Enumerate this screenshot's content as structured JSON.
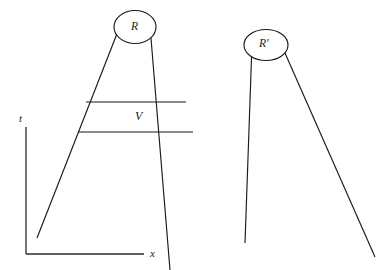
{
  "figure": {
    "type": "spacetime-diagram",
    "background_color": "#ffffff",
    "line_color": "#1a1a1a",
    "axes": {
      "vertical_label": "t",
      "horizontal_label": "x",
      "origin": {
        "x": 26,
        "y": 254
      },
      "vertical_top": {
        "x": 26,
        "y": 127
      },
      "horizontal_right": {
        "x": 144,
        "y": 254
      }
    },
    "regions": [
      {
        "name": "region-R",
        "label": "R",
        "ellipse": {
          "cx": 135,
          "cy": 27,
          "rx": 21,
          "ry": 16.5
        },
        "left_leg": {
          "x1": 37,
          "y1": 238,
          "x2": 120,
          "y2": 26
        },
        "right_leg": {
          "x1": 150,
          "y1": 26,
          "x2": 170,
          "y2": 270
        }
      },
      {
        "name": "region-R-prime",
        "label": "R'",
        "ellipse": {
          "cx": 266,
          "cy": 45,
          "rx": 22,
          "ry": 15.5
        },
        "left_leg": {
          "x1": 245,
          "y1": 243,
          "x2": 252,
          "y2": 44
        },
        "right_leg": {
          "x1": 281,
          "y1": 44,
          "x2": 375,
          "y2": 257
        }
      }
    ],
    "interval": {
      "name": "band-V",
      "label": "V",
      "upper_chord": {
        "x1": 86,
        "y1": 102,
        "x2": 186,
        "y2": 102
      },
      "lower_chord": {
        "x1": 78,
        "y1": 132,
        "x2": 193,
        "y2": 132
      }
    },
    "crossing_point": {
      "x": 207,
      "y": 153
    }
  }
}
